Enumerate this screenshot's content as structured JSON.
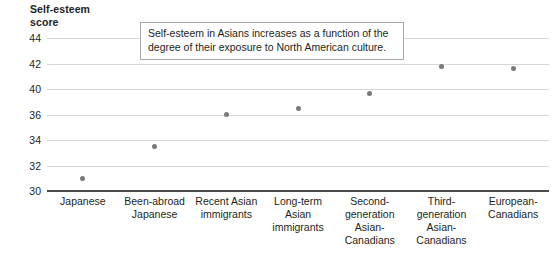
{
  "chart_data": {
    "type": "scatter",
    "title": "",
    "ylabel": "Self-esteem\nscore",
    "xlabel": "",
    "ylim": [
      30,
      44
    ],
    "grid": true,
    "legend": "none",
    "y_ticks": [
      "44",
      "42",
      "40",
      "36",
      "34",
      "32",
      "30"
    ],
    "categories": [
      "Japanese",
      "Been-abroad\nJapanese",
      "Recent Asian\nimmigrants",
      "Long-term\nAsian\nimmigrants",
      "Second-\ngeneration\nAsian-\nCanadians",
      "Third-\ngeneration\nAsian-\nCanadians",
      "European-\nCanadians"
    ],
    "values": [
      31.0,
      33.5,
      36.0,
      36.9,
      39.3,
      41.8,
      41.6
    ],
    "point_color": "#7a7a7c",
    "gridline_color": "#d6d7d8",
    "axis_color": "#4b4b4d",
    "annotations": [
      {
        "text": "Self-esteem in Asians increases as a function of the degree of their exposure to North American culture.",
        "border_color": "#a7a9ac"
      }
    ]
  },
  "annotation": {
    "text": "Self-esteem in Asians increases as a function of the degree of their exposure to North American culture."
  },
  "axis": {
    "y_title": "Self-esteem\nscore"
  }
}
